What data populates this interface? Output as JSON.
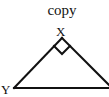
{
  "diagram": {
    "caption": "copy",
    "type": "right-triangle",
    "vertices": {
      "apex": {
        "label": "X",
        "right_angle": true
      },
      "left": {
        "label": "Y"
      },
      "right": {
        "label": ""
      }
    },
    "stroke_color": "#111111",
    "background_color": "#ffffff"
  }
}
